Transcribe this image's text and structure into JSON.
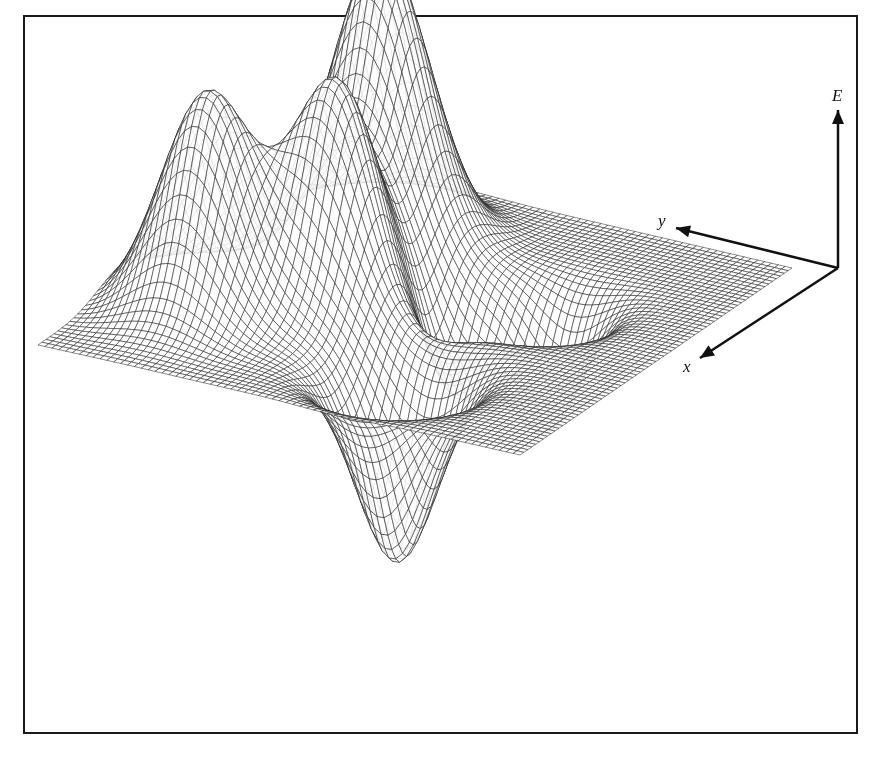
{
  "figure": {
    "line_color": "#1a1a1a",
    "background": "#ffffff"
  },
  "axes": {
    "vertical_label": "E",
    "y_label": "y",
    "x_label": "x",
    "origin_px": [
      838,
      268
    ],
    "e_tip_px": [
      838,
      110
    ],
    "y_tip_px": [
      676,
      228
    ],
    "x_tip_px": [
      700,
      358
    ]
  },
  "chart_data": {
    "type": "surface",
    "title": "",
    "xlabel": "x",
    "ylabel": "y",
    "zlabel": "E",
    "grid": "wireframe mesh",
    "peaks": [
      {
        "name": "left-peak",
        "apex_px": [
          355,
          122
        ],
        "relative_height": 1.0
      },
      {
        "name": "middle-peak",
        "apex_px": [
          425,
          138
        ],
        "relative_height": 0.95
      },
      {
        "name": "right-peak",
        "apex_px": [
          525,
          68
        ],
        "relative_height": 1.2
      }
    ],
    "valleys": [
      {
        "name": "left-valley",
        "bottom_px": [
          307,
          552
        ],
        "relative_depth": -0.95
      },
      {
        "name": "middle-valley",
        "bottom_px": [
          413,
          485
        ],
        "relative_depth": -0.55
      },
      {
        "name": "right-valley",
        "bottom_px": [
          472,
          515
        ],
        "relative_depth": -0.7
      }
    ],
    "plane_corners_px": {
      "left": [
        38,
        345
      ],
      "back": [
        315,
        157
      ],
      "right": [
        792,
        268
      ],
      "front": [
        520,
        455
      ]
    }
  }
}
